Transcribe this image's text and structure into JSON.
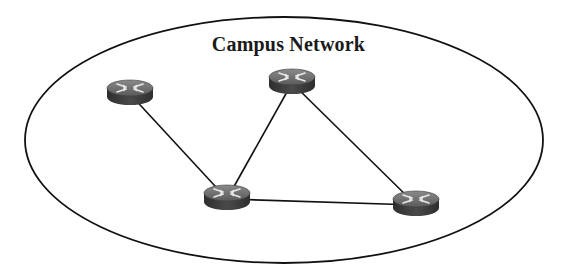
{
  "diagram": {
    "title": "Campus Network",
    "boundary": {
      "shape": "ellipse",
      "cx": 284,
      "cy": 140,
      "rx": 259,
      "ry": 123,
      "stroke": "#111111"
    },
    "nodes": [
      {
        "id": "router-1",
        "type": "router-icon",
        "x": 130,
        "y": 88
      },
      {
        "id": "router-2",
        "type": "router-icon",
        "x": 292,
        "y": 77
      },
      {
        "id": "router-3",
        "type": "router-icon",
        "x": 227,
        "y": 193
      },
      {
        "id": "router-4",
        "type": "router-icon",
        "x": 416,
        "y": 199
      }
    ],
    "links": [
      {
        "from": "router-1",
        "to": "router-3"
      },
      {
        "from": "router-2",
        "to": "router-3"
      },
      {
        "from": "router-2",
        "to": "router-4"
      },
      {
        "from": "router-3",
        "to": "router-4"
      }
    ],
    "colors": {
      "router_top": "#6e6e6e",
      "router_side": "#3a3a3a",
      "router_arrows": "#e8e8e8",
      "link": "#111111"
    }
  }
}
